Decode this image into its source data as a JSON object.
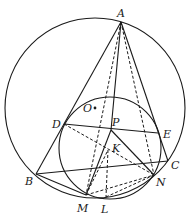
{
  "diagram": {
    "type": "geometry",
    "circles": [
      {
        "name": "circumcircle",
        "center": "O",
        "cx": 95,
        "cy": 108,
        "r": 90
      },
      {
        "name": "small-circle",
        "cx": 110,
        "cy": 148,
        "r": 51
      }
    ],
    "points": {
      "A": {
        "x": 121,
        "y": 22,
        "label": "A",
        "lx": 117,
        "ly": 17
      },
      "B": {
        "x": 36,
        "y": 174,
        "label": "B",
        "lx": 25,
        "ly": 185
      },
      "C": {
        "x": 168,
        "y": 161,
        "label": "C",
        "lx": 171,
        "ly": 169
      },
      "D": {
        "x": 64,
        "y": 124,
        "label": "D",
        "lx": 52,
        "ly": 128
      },
      "E": {
        "x": 158,
        "y": 133,
        "label": "E",
        "lx": 163,
        "ly": 138
      },
      "P": {
        "x": 111,
        "y": 130,
        "label": "P",
        "lx": 112,
        "ly": 126
      },
      "K": {
        "x": 108,
        "y": 150,
        "label": "K",
        "lx": 112,
        "ly": 152
      },
      "M": {
        "x": 86,
        "y": 195,
        "label": "M",
        "lx": 77,
        "ly": 212
      },
      "N": {
        "x": 154,
        "y": 175,
        "label": "N",
        "lx": 156,
        "ly": 186
      },
      "L": {
        "x": 106,
        "y": 197,
        "label": "L",
        "lx": 101,
        "ly": 213
      },
      "O": {
        "x": 95,
        "y": 108,
        "label": "O",
        "lx": 83,
        "ly": 112
      }
    },
    "solid_segments": [
      [
        "A",
        "B"
      ],
      [
        "A",
        "C"
      ],
      [
        "B",
        "C"
      ],
      [
        "B",
        "M"
      ],
      [
        "D",
        "E"
      ],
      [
        "A",
        "P"
      ],
      [
        "P",
        "M"
      ],
      [
        "P",
        "N"
      ]
    ],
    "dashed_segments": [
      [
        "A",
        "M"
      ],
      [
        "A",
        "N"
      ],
      [
        "D",
        "N"
      ],
      [
        "M",
        "K"
      ],
      [
        "K",
        "L"
      ],
      [
        "M",
        "N"
      ],
      [
        "L",
        "N"
      ]
    ]
  }
}
